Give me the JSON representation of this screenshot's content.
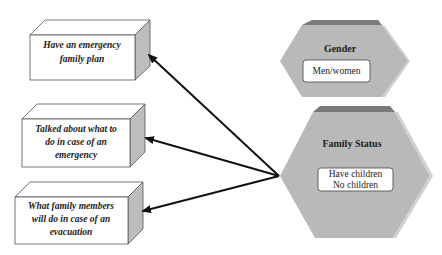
{
  "diagram": {
    "outcomes": [
      {
        "id": "outcome-1",
        "lines": [
          "Have an emergency",
          "family plan"
        ]
      },
      {
        "id": "outcome-2",
        "lines": [
          "Talked about  what to",
          "do in case of an",
          "emergency"
        ]
      },
      {
        "id": "outcome-3",
        "lines": [
          "What family members",
          "will do in  case of an",
          "evacuation"
        ]
      }
    ],
    "factors": [
      {
        "id": "gender",
        "title": "Gender",
        "values": [
          "Men/women"
        ]
      },
      {
        "id": "family-status",
        "title": "Family Status",
        "values": [
          "Have children",
          "No children"
        ]
      }
    ],
    "edges": [
      {
        "from": "family-status",
        "to": "outcome-1"
      },
      {
        "from": "family-status",
        "to": "outcome-2"
      },
      {
        "from": "family-status",
        "to": "outcome-3"
      }
    ],
    "colors": {
      "hex_fill": "#b9b9b9",
      "hex_top": "#7a7a7a",
      "hex_side": "#d2d2d2",
      "box_side": "#bdbdbd",
      "arrow": "#111111"
    }
  }
}
